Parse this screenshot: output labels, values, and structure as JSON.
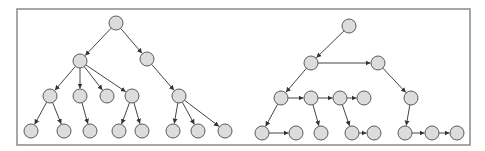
{
  "frame": {
    "x": 17,
    "y": 9,
    "width": 453,
    "height": 136,
    "stroke": "#8a8a8a"
  },
  "style": {
    "node_fill": "#dcdcdc",
    "node_stroke": "#5a5a5a",
    "edge_color": "#444444",
    "node_radius": 7
  },
  "trees": [
    {
      "name": "left-tree",
      "nodes": [
        {
          "id": "L0",
          "x": 116,
          "y": 23
        },
        {
          "id": "L1",
          "x": 80,
          "y": 61
        },
        {
          "id": "L2",
          "x": 147,
          "y": 59
        },
        {
          "id": "L3",
          "x": 50,
          "y": 96
        },
        {
          "id": "L4",
          "x": 80,
          "y": 96
        },
        {
          "id": "L5",
          "x": 107,
          "y": 96
        },
        {
          "id": "L6",
          "x": 132,
          "y": 96
        },
        {
          "id": "L7",
          "x": 179,
          "y": 96
        },
        {
          "id": "L8",
          "x": 31,
          "y": 131
        },
        {
          "id": "L9",
          "x": 64,
          "y": 131
        },
        {
          "id": "L10",
          "x": 90,
          "y": 131
        },
        {
          "id": "L11",
          "x": 119,
          "y": 131
        },
        {
          "id": "L12",
          "x": 142,
          "y": 131
        },
        {
          "id": "L13",
          "x": 173,
          "y": 131
        },
        {
          "id": "L14",
          "x": 198,
          "y": 131
        },
        {
          "id": "L15",
          "x": 225,
          "y": 131
        }
      ],
      "edges": [
        [
          "L0",
          "L1"
        ],
        [
          "L0",
          "L2"
        ],
        [
          "L1",
          "L3"
        ],
        [
          "L1",
          "L4"
        ],
        [
          "L1",
          "L5"
        ],
        [
          "L1",
          "L6"
        ],
        [
          "L2",
          "L7"
        ],
        [
          "L3",
          "L8"
        ],
        [
          "L3",
          "L9"
        ],
        [
          "L4",
          "L10"
        ],
        [
          "L6",
          "L11"
        ],
        [
          "L6",
          "L12"
        ],
        [
          "L7",
          "L13"
        ],
        [
          "L7",
          "L14"
        ],
        [
          "L7",
          "L15"
        ]
      ]
    },
    {
      "name": "right-tree",
      "nodes": [
        {
          "id": "R0",
          "x": 349,
          "y": 26
        },
        {
          "id": "R1",
          "x": 311,
          "y": 63
        },
        {
          "id": "R2",
          "x": 378,
          "y": 63
        },
        {
          "id": "R3",
          "x": 281,
          "y": 98
        },
        {
          "id": "R4",
          "x": 311,
          "y": 98
        },
        {
          "id": "R5",
          "x": 340,
          "y": 98
        },
        {
          "id": "R6",
          "x": 364,
          "y": 98
        },
        {
          "id": "R7",
          "x": 411,
          "y": 98
        },
        {
          "id": "R8",
          "x": 262,
          "y": 133
        },
        {
          "id": "R9",
          "x": 296,
          "y": 133
        },
        {
          "id": "R10",
          "x": 321,
          "y": 133
        },
        {
          "id": "R11",
          "x": 352,
          "y": 133
        },
        {
          "id": "R12",
          "x": 374,
          "y": 133
        },
        {
          "id": "R13",
          "x": 405,
          "y": 133
        },
        {
          "id": "R14",
          "x": 432,
          "y": 133
        },
        {
          "id": "R15",
          "x": 457,
          "y": 133
        }
      ],
      "edges": [
        [
          "R0",
          "R1"
        ],
        [
          "R1",
          "R2"
        ],
        [
          "R1",
          "R3"
        ],
        [
          "R2",
          "R7"
        ],
        [
          "R3",
          "R4"
        ],
        [
          "R4",
          "R5"
        ],
        [
          "R5",
          "R6"
        ],
        [
          "R3",
          "R8"
        ],
        [
          "R8",
          "R9"
        ],
        [
          "R4",
          "R10"
        ],
        [
          "R5",
          "R11"
        ],
        [
          "R11",
          "R12"
        ],
        [
          "R7",
          "R13"
        ],
        [
          "R13",
          "R14"
        ],
        [
          "R14",
          "R15"
        ]
      ]
    }
  ]
}
